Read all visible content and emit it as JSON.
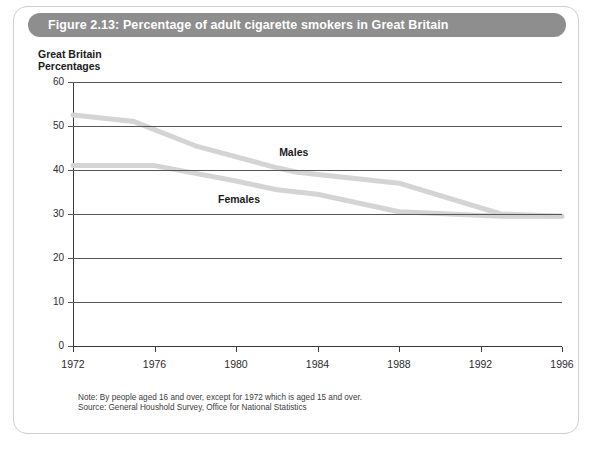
{
  "figure": {
    "title": "Figure 2.13: Percentage of adult cigarette smokers in Great Britain",
    "header_color": "#8e8e8e",
    "panel_background": "#ffffff"
  },
  "axis_heading": {
    "line1": "Great Britain",
    "line2": "Percentages"
  },
  "footnotes": {
    "note": "Note: By people aged 16 and over, except for 1972 which is aged 15 and over.",
    "source": "Source: General Houshold Survey, Office for National Statistics"
  },
  "chart_data": {
    "type": "line",
    "title": "Percentage of adult cigarette smokers in Great Britain",
    "subtitle": "Great Britain Percentages",
    "xlabel": "",
    "ylabel": "Percentages",
    "xlim": [
      1972,
      1996
    ],
    "ylim": [
      0,
      60
    ],
    "yticks": [
      0,
      10,
      20,
      30,
      40,
      50,
      60
    ],
    "ytick_labels": [
      "0",
      "10",
      "20",
      "30",
      "40",
      "50",
      "60"
    ],
    "xticks": [
      1972,
      1976,
      1980,
      1984,
      1988,
      1992,
      1996
    ],
    "xtick_labels": [
      "1972",
      "1976",
      "1980",
      "1984",
      "1988",
      "1992",
      "1996"
    ],
    "grid": "horizontal",
    "legend": "inline-annotations",
    "line_color": "#d4d4d4",
    "line_width": 5,
    "series": [
      {
        "name": "Males",
        "label_position": {
          "x": 1983,
          "y": 44
        },
        "x": [
          1972,
          1975,
          1978,
          1982,
          1983,
          1988,
          1993,
          1996
        ],
        "values": [
          52.5,
          51,
          45.5,
          40.5,
          39.5,
          37,
          30,
          29.5
        ]
      },
      {
        "name": "Females",
        "label_position": {
          "x": 1980,
          "y": 33.5
        },
        "x": [
          1972,
          1976,
          1980,
          1982,
          1984,
          1988,
          1993,
          1996
        ],
        "values": [
          41,
          41,
          37.5,
          35.5,
          34.5,
          30.5,
          29.5,
          29.5
        ]
      }
    ]
  }
}
